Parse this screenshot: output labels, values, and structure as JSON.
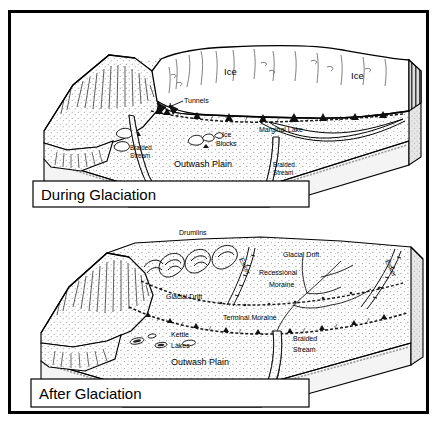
{
  "figure": {
    "type": "geological-block-diagram"
  },
  "panels": [
    {
      "id": "during-glaciation",
      "title": "During Glaciation",
      "labels": [
        {
          "key": "ice_center",
          "text": "Ice"
        },
        {
          "key": "ice_right",
          "text": "Ice"
        },
        {
          "key": "tunnels",
          "text": "Tunnels"
        },
        {
          "key": "ice_blocks_line1",
          "text": "Ice"
        },
        {
          "key": "ice_blocks_line2",
          "text": "Blocks"
        },
        {
          "key": "marginal_lake",
          "text": "Marginal Lake"
        },
        {
          "key": "braided_stream_left_line1",
          "text": "Braided"
        },
        {
          "key": "braided_stream_left_line2",
          "text": "Stream"
        },
        {
          "key": "braided_stream_right_line1",
          "text": "Braided"
        },
        {
          "key": "braided_stream_right_line2",
          "text": "Stream"
        },
        {
          "key": "outwash_plain",
          "text": "Outwash Plain"
        }
      ]
    },
    {
      "id": "after-glaciation",
      "title": "After Glaciation",
      "labels": [
        {
          "key": "drumlins",
          "text": "Drumlins"
        },
        {
          "key": "esker_left",
          "text": "Esker"
        },
        {
          "key": "esker_right",
          "text": "Esker"
        },
        {
          "key": "glacial_drift_right",
          "text": "Glacial Drift"
        },
        {
          "key": "glacial_drift_left",
          "text": "Glacial Drift"
        },
        {
          "key": "recessional_moraine_line1",
          "text": "Recessional"
        },
        {
          "key": "recessional_moraine_line2",
          "text": "Moraine"
        },
        {
          "key": "terminal_moraine",
          "text": "Terminal Moraine"
        },
        {
          "key": "kettle_lakes_line1",
          "text": "Kettle"
        },
        {
          "key": "kettle_lakes_line2",
          "text": "Lakes"
        },
        {
          "key": "braided_stream_line1",
          "text": "Braided"
        },
        {
          "key": "braided_stream_line2",
          "text": "Stream"
        },
        {
          "key": "outwash_plain",
          "text": "Outwash Plain"
        }
      ]
    }
  ],
  "colors": {
    "ink": "#000000",
    "paper": "#ffffff",
    "stipple": "#7a7a7a",
    "shade": "#b9b9b9",
    "dark_shade": "#6e6e6e"
  }
}
